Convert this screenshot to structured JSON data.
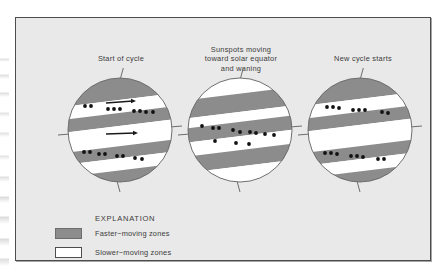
{
  "figure": {
    "background_color": "#ffffff",
    "panel_background_color": "#e9e9e9",
    "panel_border_color": "#4d4d4d"
  },
  "colors": {
    "faster_zone": "#8c8c8c",
    "slower_zone": "#ffffff",
    "sun_outline": "#6d6d6d",
    "sunspot": "#111111",
    "text": "#3b3b3b",
    "arrow": "#1a1a1a"
  },
  "panels": [
    {
      "id": "start-of-cycle",
      "caption": "Start of cycle",
      "arrows": [
        {
          "label": "upper-zone-flow-arrow"
        },
        {
          "label": "equator-zone-flow-arrow"
        }
      ],
      "sunspot_count": 22
    },
    {
      "id": "sunspots-moving-toward-equator",
      "caption": "Sunspots moving\ntoward solar equator\nand waning",
      "arrows": [],
      "sunspot_count": 15
    },
    {
      "id": "new-cycle-starts",
      "caption": "New cycle starts",
      "arrows": [],
      "sunspot_count": 20
    }
  ],
  "legend": {
    "title": "EXPLANATION",
    "items": [
      {
        "swatch": "faster",
        "label": "Faster−moving zones"
      },
      {
        "swatch": "slower",
        "label": "Slower−moving zones"
      }
    ]
  },
  "chart_data": {
    "type": "diagram",
    "sun_radius_px": 52,
    "band_tilt_deg": -7,
    "spheres": [
      {
        "name": "Start of cycle",
        "bands": [
          {
            "zone": "faster",
            "y_top": -52,
            "y_bottom": -30
          },
          {
            "zone": "slower",
            "y_top": -30,
            "y_bottom": -17
          },
          {
            "zone": "faster",
            "y_top": -17,
            "y_bottom": -4
          },
          {
            "zone": "slower",
            "y_top": -4,
            "y_bottom": 16
          },
          {
            "zone": "faster",
            "y_top": 16,
            "y_bottom": 28
          },
          {
            "zone": "slower",
            "y_top": 28,
            "y_bottom": 40
          },
          {
            "zone": "faster",
            "y_top": 40,
            "y_bottom": 52
          }
        ],
        "sunspots": [
          {
            "x": -35,
            "y": -24
          },
          {
            "x": -29,
            "y": -24
          },
          {
            "x": -12,
            "y": -21
          },
          {
            "x": -6,
            "y": -21
          },
          {
            "x": 0,
            "y": -21
          },
          {
            "x": 14,
            "y": -19
          },
          {
            "x": 20,
            "y": -19
          },
          {
            "x": 26,
            "y": -18
          },
          {
            "x": 33,
            "y": -18
          },
          {
            "x": -36,
            "y": 22
          },
          {
            "x": -30,
            "y": 22
          },
          {
            "x": -21,
            "y": 24
          },
          {
            "x": -15,
            "y": 24
          },
          {
            "x": -3,
            "y": 26
          },
          {
            "x": 3,
            "y": 26
          },
          {
            "x": 15,
            "y": 28
          },
          {
            "x": 22,
            "y": 29
          }
        ],
        "arrows": [
          {
            "x1": -14,
            "y1": -27,
            "x2": 16,
            "y2": -29
          },
          {
            "x1": -14,
            "y1": 4,
            "x2": 18,
            "y2": 3
          }
        ]
      },
      {
        "name": "Sunspots moving toward solar equator and waning",
        "bands": [
          {
            "zone": "slower",
            "y_top": -52,
            "y_bottom": -36
          },
          {
            "zone": "faster",
            "y_top": -36,
            "y_bottom": -18
          },
          {
            "zone": "slower",
            "y_top": -18,
            "y_bottom": -8
          },
          {
            "zone": "faster",
            "y_top": -8,
            "y_bottom": 6
          },
          {
            "zone": "slower",
            "y_top": 6,
            "y_bottom": 20
          },
          {
            "zone": "faster",
            "y_top": 20,
            "y_bottom": 36
          },
          {
            "zone": "slower",
            "y_top": 36,
            "y_bottom": 52
          }
        ],
        "sunspots": [
          {
            "x": -38,
            "y": -4
          },
          {
            "x": -27,
            "y": -2
          },
          {
            "x": -21,
            "y": -2
          },
          {
            "x": -7,
            "y": 0
          },
          {
            "x": 0,
            "y": 2
          },
          {
            "x": 10,
            "y": 2
          },
          {
            "x": 16,
            "y": 3
          },
          {
            "x": 25,
            "y": 4
          },
          {
            "x": 34,
            "y": 5
          },
          {
            "x": -25,
            "y": 11
          },
          {
            "x": -4,
            "y": 13
          },
          {
            "x": 9,
            "y": 14
          }
        ],
        "arrows": []
      },
      {
        "name": "New cycle starts",
        "bands": [
          {
            "zone": "faster",
            "y_top": -52,
            "y_bottom": -31
          },
          {
            "zone": "slower",
            "y_top": -31,
            "y_bottom": -18
          },
          {
            "zone": "faster",
            "y_top": -18,
            "y_bottom": -5
          },
          {
            "zone": "slower",
            "y_top": -5,
            "y_bottom": 16
          },
          {
            "zone": "faster",
            "y_top": 16,
            "y_bottom": 29
          },
          {
            "zone": "slower",
            "y_top": 29,
            "y_bottom": 41
          },
          {
            "zone": "faster",
            "y_top": 41,
            "y_bottom": 52
          }
        ],
        "sunspots": [
          {
            "x": -33,
            "y": -23
          },
          {
            "x": -27,
            "y": -23
          },
          {
            "x": -21,
            "y": -22
          },
          {
            "x": -7,
            "y": -20
          },
          {
            "x": -1,
            "y": -20
          },
          {
            "x": 5,
            "y": -20
          },
          {
            "x": 22,
            "y": -18
          },
          {
            "x": 28,
            "y": -17
          },
          {
            "x": -35,
            "y": 23
          },
          {
            "x": -29,
            "y": 23
          },
          {
            "x": -23,
            "y": 24
          },
          {
            "x": -9,
            "y": 26
          },
          {
            "x": -3,
            "y": 26
          },
          {
            "x": 3,
            "y": 27
          },
          {
            "x": 18,
            "y": 29
          },
          {
            "x": 24,
            "y": 29
          }
        ],
        "arrows": []
      }
    ],
    "legend": {
      "position": "bottom-left",
      "title": "EXPLANATION",
      "entries": [
        "Faster−moving zones",
        "Slower−moving zones"
      ]
    }
  }
}
